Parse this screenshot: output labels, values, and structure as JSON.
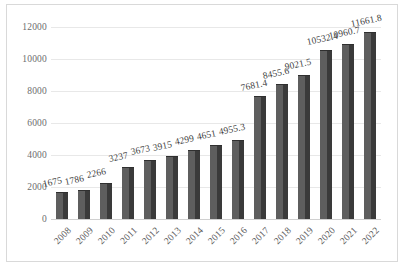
{
  "chart_data": {
    "type": "bar",
    "title": "",
    "xlabel": "",
    "ylabel": "",
    "categories": [
      "2008",
      "2009",
      "2010",
      "2011",
      "2012",
      "2013",
      "2014",
      "2015",
      "2016",
      "2017",
      "2018",
      "2019",
      "2020",
      "2021",
      "2022"
    ],
    "values": [
      1675,
      1786,
      2266,
      3237,
      3673,
      3915,
      4299,
      4651,
      4955.3,
      7681.4,
      8455.6,
      9021.5,
      10532.4,
      10960.7,
      11661.8
    ],
    "data_labels": [
      "1675",
      "1786",
      "2266",
      "3237",
      "3673",
      "3915",
      "4299",
      "4651",
      "4955.3",
      "7681.4",
      "8455.6",
      "9021.5",
      "10532.4",
      "10960.7",
      "11661.8"
    ],
    "ylim": [
      0,
      12000
    ],
    "yticks": [
      0,
      2000,
      4000,
      6000,
      8000,
      10000,
      12000
    ],
    "ytick_labels": [
      "0",
      "2000",
      "4000",
      "6000",
      "8000",
      "10000",
      "12000"
    ],
    "grid": true,
    "legend": false,
    "legend_position": "none",
    "series": [
      {
        "name": "",
        "values": [
          1675,
          1786,
          2266,
          3237,
          3673,
          3915,
          4299,
          4651,
          4955.3,
          7681.4,
          8455.6,
          9021.5,
          10532.4,
          10960.7,
          11661.8
        ]
      }
    ],
    "colors": {
      "bar_face": "#5e5e5e",
      "bar_shade": "#3a3a3a",
      "gridline": "#e8e8e8",
      "plot_background": "#ffffff",
      "frame_border": "#d9d9d9",
      "tick_text": "#6d6d6d",
      "label_text": "#3f3f3f"
    }
  }
}
